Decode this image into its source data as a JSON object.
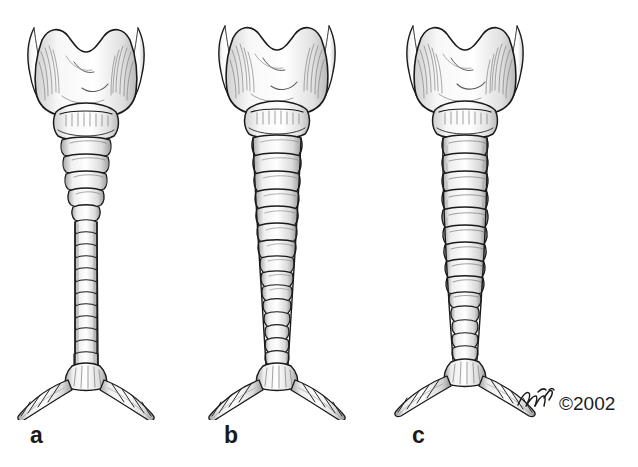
{
  "figure": {
    "background_color": "#ffffff",
    "ink_color": "#1a1a1a",
    "shading_color": "#6f6f6f",
    "medium": "pen-and-ink line drawing with hatched shading"
  },
  "panels": [
    {
      "id": "a",
      "label": "a",
      "caliber": "severely narrowed",
      "description": "Larynx with thyroid cartilage and cricoid cartilage above a markedly narrowed trachea that funnels abruptly below the cricoid and remains thin to the carina",
      "tracheal_ring_count": 18,
      "parts": [
        "superior cornu (left)",
        "superior cornu (right)",
        "thyroid cartilage lamina",
        "thyroid notch",
        "cricoid cartilage",
        "tracheal rings",
        "carina",
        "right main bronchus",
        "left main bronchus"
      ]
    },
    {
      "id": "b",
      "label": "b",
      "caliber": "moderately narrowed",
      "description": "Larynx above a trachea of intermediate caliber that tapers gradually from the cricoid toward the carina",
      "tracheal_ring_count": 19,
      "parts": [
        "superior cornu (left)",
        "superior cornu (right)",
        "thyroid cartilage lamina",
        "thyroid notch",
        "cricoid cartilage",
        "tracheal rings",
        "carina",
        "right main bronchus",
        "left main bronchus"
      ]
    },
    {
      "id": "c",
      "label": "c",
      "caliber": "widest / near-normal",
      "description": "Larynx above a broad trachea of nearly uniform caliber that narrows only in its lower third before the carina",
      "tracheal_ring_count": 17,
      "parts": [
        "superior cornu (left)",
        "superior cornu (right)",
        "thyroid cartilage lamina",
        "thyroid notch",
        "cricoid cartilage",
        "tracheal rings",
        "carina",
        "right main bronchus",
        "left main bronchus"
      ]
    }
  ],
  "credit": {
    "signature": "artist signature",
    "copyright": "©2002"
  }
}
